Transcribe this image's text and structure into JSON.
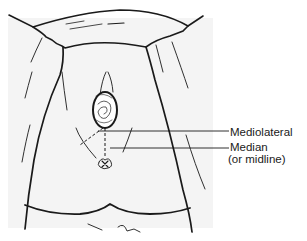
{
  "diagram": {
    "labels": {
      "mediolateral": "Mediolateral",
      "median": "Median",
      "median_note": "(or midline)"
    },
    "colors": {
      "line": "#1a1a1a",
      "background": "#ffffff",
      "skin_shade": "#f4f4f4"
    }
  }
}
